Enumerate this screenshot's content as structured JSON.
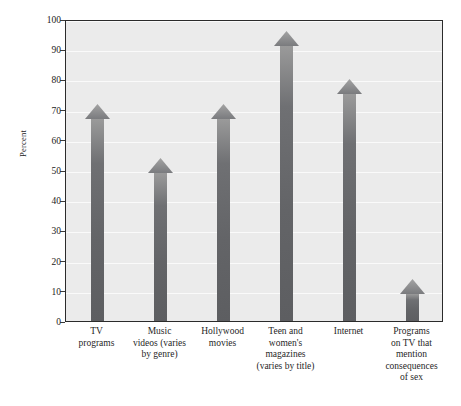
{
  "chart_data": {
    "type": "bar",
    "title": "",
    "subtitle": "",
    "xlabel": "",
    "ylabel": "Percent",
    "ylim": [
      0,
      100
    ],
    "yticks": [
      0,
      10,
      20,
      30,
      40,
      50,
      60,
      70,
      80,
      90,
      100
    ],
    "ytick_labels": [
      "0",
      "10",
      "20",
      "30",
      "40",
      "50",
      "60",
      "70",
      "80",
      "90",
      "100"
    ],
    "grid": true,
    "legend": "none",
    "categories": [
      "TV\nprograms",
      "Music\nvideos (varies\nby genre)",
      "Hollywood\nmovies",
      "Teen and\nwomen's\nmagazines\n(varies by title)",
      "Internet",
      "Programs\non TV that\nmention\nconsequences\nof sex"
    ],
    "values": [
      72,
      54,
      72,
      96,
      80,
      14
    ],
    "bar_style": "arrow",
    "bar_color": "#6a6b6e",
    "plot_background": "#ebebeb",
    "gridline_color": "#fafafa",
    "frame_color": "#2b2b2b"
  },
  "axis": {
    "y_title": "Percent"
  },
  "categories": [
    {
      "lines": [
        "TV",
        "programs"
      ]
    },
    {
      "lines": [
        "Music",
        "videos (varies",
        "by genre)"
      ]
    },
    {
      "lines": [
        "Hollywood",
        "movies"
      ]
    },
    {
      "lines": [
        "Teen and",
        "women's",
        "magazines",
        "(varies by title)"
      ]
    },
    {
      "lines": [
        "Internet"
      ]
    },
    {
      "lines": [
        "Programs",
        "on TV that",
        "mention",
        "consequences",
        "of sex"
      ]
    }
  ]
}
